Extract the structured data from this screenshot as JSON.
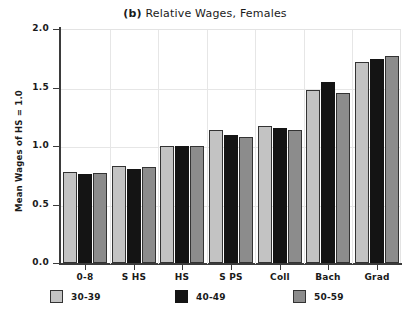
{
  "chart_data": {
    "type": "bar",
    "title": "(b)  Relative Wages, Females",
    "panel_letter": "(b)",
    "title_text": "Relative Wages, Females",
    "xlabel": "",
    "ylabel": "Mean Wages of HS = 1.0",
    "categories": [
      "0-8",
      "S HS",
      "HS",
      "S PS",
      "Coll",
      "Bach",
      "Grad"
    ],
    "series": [
      {
        "name": "30-39",
        "color": "#c3c3c3",
        "values": [
          0.78,
          0.83,
          1.0,
          1.14,
          1.17,
          1.48,
          1.72
        ]
      },
      {
        "name": "40-49",
        "color": "#141414",
        "values": [
          0.76,
          0.8,
          1.0,
          1.09,
          1.15,
          1.55,
          1.74
        ]
      },
      {
        "name": "50-59",
        "color": "#8c8c8c",
        "values": [
          0.77,
          0.82,
          1.0,
          1.08,
          1.14,
          1.45,
          1.77
        ]
      }
    ],
    "ylim": [
      0.0,
      2.0
    ],
    "ytick_values": [
      0.0,
      0.5,
      1.0,
      1.5,
      2.0
    ],
    "ytick_labels": [
      "0.0",
      "0.5",
      "1.0",
      "1.5",
      "2.0"
    ],
    "grid": "horizontal-and-vertical-separators",
    "legend_position": "bottom",
    "legend": [
      "30-39",
      "40-49",
      "50-59"
    ]
  }
}
